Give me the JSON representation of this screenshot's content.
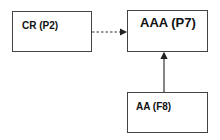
{
  "nodes": [
    {
      "id": "cr",
      "label": "CR (P2)"
    },
    {
      "id": "aaa",
      "label": "AAA (P7)"
    },
    {
      "id": "aa",
      "label": "AA (F8)"
    }
  ],
  "edges": [
    {
      "from": "cr",
      "to": "aaa",
      "style": "dashed"
    },
    {
      "from": "aa",
      "to": "aaa",
      "style": "solid"
    }
  ],
  "colors": {
    "stroke": "#444444",
    "text": "#111111",
    "background": "#ffffff"
  }
}
